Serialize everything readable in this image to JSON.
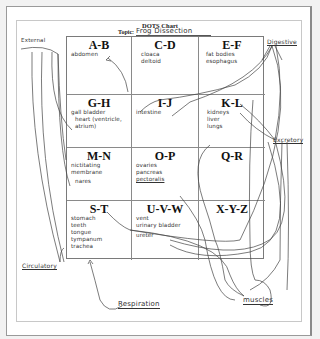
{
  "chart": {
    "title": "DOTS Chart",
    "topic_label": "Topic:",
    "topic_value": "Frog Dissection"
  },
  "cells": [
    {
      "letters": "A-B",
      "entries": [
        "abdomen"
      ]
    },
    {
      "letters": "C-D",
      "entries": [
        "cloaca",
        "deltoid"
      ]
    },
    {
      "letters": "E-F",
      "entries": [
        "fat bodies",
        "esophagus"
      ]
    },
    {
      "letters": "G-H",
      "entries": [
        "gall bladder",
        "heart (ventricle, atrium)"
      ]
    },
    {
      "letters": "I-J",
      "entries": [
        "intestine"
      ]
    },
    {
      "letters": "K-L",
      "entries": [
        "kidneys",
        "liver",
        "lungs"
      ]
    },
    {
      "letters": "M-N",
      "entries": [
        "nictitating membrane",
        "nares"
      ]
    },
    {
      "letters": "O-P",
      "entries": [
        "ovaries",
        "pancreas",
        "pectoralis"
      ]
    },
    {
      "letters": "Q-R",
      "entries": []
    },
    {
      "letters": "S-T",
      "entries": [
        "stomach",
        "teeth",
        "tongue",
        "tympanum",
        "trachea"
      ]
    },
    {
      "letters": "U-V-W",
      "entries": [
        "vent",
        "urinary bladder",
        "ureter"
      ]
    },
    {
      "letters": "X-Y-Z",
      "entries": []
    }
  ],
  "annotations": {
    "external": "External",
    "digestive": "Digestive",
    "excretory": "Excretory",
    "circulatory": "Circulatory",
    "respiration": "Respiration",
    "muscles": "muscles"
  }
}
